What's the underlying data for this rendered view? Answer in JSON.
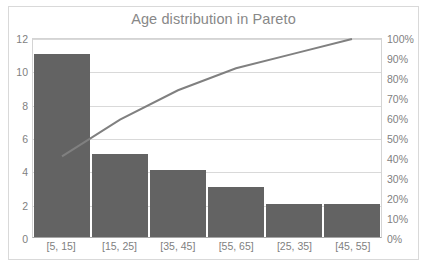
{
  "chart_data": {
    "type": "bar",
    "title": "Age distribution in Pareto",
    "xlabel": "",
    "ylabel": "",
    "categories": [
      "[5, 15]",
      "[15, 25]",
      "[35, 45]",
      "[55, 65]",
      "[25, 35]",
      "[45, 55]"
    ],
    "series": [
      {
        "name": "Frequency",
        "type": "bar",
        "axis": "left",
        "values": [
          11,
          5,
          4,
          3,
          2,
          2
        ]
      },
      {
        "name": "Cumulative percentage",
        "type": "line",
        "axis": "right",
        "values": [
          40.7,
          59.3,
          74.1,
          85.2,
          92.6,
          100
        ]
      }
    ],
    "total": 27,
    "ylim": [
      0,
      12
    ],
    "y2lim": [
      0,
      100
    ],
    "yticks": [
      0,
      2,
      4,
      6,
      8,
      10,
      12
    ],
    "ytick_labels": [
      "0",
      "2",
      "4",
      "6",
      "8",
      "10",
      "12"
    ],
    "y2ticks": [
      0,
      10,
      20,
      30,
      40,
      50,
      60,
      70,
      80,
      90,
      100
    ],
    "y2tick_labels": [
      "0%",
      "10%",
      "20%",
      "30%",
      "40%",
      "50%",
      "60%",
      "70%",
      "80%",
      "90%",
      "100%"
    ],
    "grid": true,
    "legend": false,
    "colors": {
      "bar": "#636363",
      "line": "#808080",
      "gridline": "#d9d9d9",
      "axis_text": "#7f7f7f",
      "title_text": "#888888",
      "frame_border": "#d9d9d9",
      "plot_background": "#ffffff"
    }
  }
}
